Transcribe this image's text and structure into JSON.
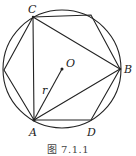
{
  "figure": {
    "caption": "图 7.1.1",
    "circle": {
      "cx": 62,
      "cy": 69,
      "r": 59
    },
    "center": {
      "label": "O",
      "x": 62,
      "y": 69
    },
    "radius_label": "r",
    "vertices": {
      "C": {
        "label": "C",
        "x": 33,
        "y": 17
      },
      "T": {
        "label": "",
        "x": 91,
        "y": 15
      },
      "B": {
        "label": "B",
        "x": 120,
        "y": 69
      },
      "D": {
        "label": "D",
        "x": 91,
        "y": 120
      },
      "A": {
        "label": "A",
        "x": 34,
        "y": 120
      },
      "L": {
        "label": "",
        "x": 4,
        "y": 70
      }
    },
    "shapes": [
      "inscribed hexagon C-T-B-D-A-L",
      "triangle A-B-C",
      "segment O-A (radius r)"
    ],
    "stroke_color": "#222222"
  }
}
